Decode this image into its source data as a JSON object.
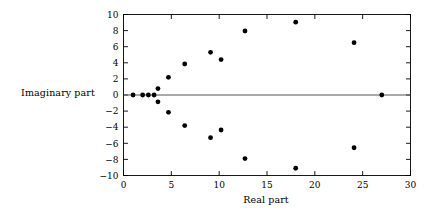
{
  "figure": {
    "xlabel": "Real part",
    "ylabel": "Imaginary part"
  },
  "chart_data": {
    "type": "scatter",
    "title": "",
    "xlabel": "Real part",
    "ylabel": "Imaginary part",
    "xlim": [
      0,
      30
    ],
    "ylim": [
      -10,
      10
    ],
    "xticks": [
      0,
      5,
      10,
      15,
      20,
      25,
      30
    ],
    "xticklabels": [
      "0",
      "5",
      "10",
      "15",
      "20",
      "25",
      "30"
    ],
    "yticks": [
      -10,
      -8,
      -6,
      -4,
      -2,
      0,
      2,
      4,
      6,
      8,
      10
    ],
    "yticklabels": [
      "−10",
      "−8",
      "−6",
      "−4",
      "−2",
      "0",
      "2",
      "4",
      "6",
      "8",
      "10"
    ],
    "grid": false,
    "legend": null,
    "marker": "filled-circle",
    "marker_color": "#000000",
    "marker_size": 2.4,
    "axis_line": {
      "y": 0,
      "color": "#555555"
    },
    "points": [
      {
        "x": 1.0,
        "y": 0.0
      },
      {
        "x": 2.0,
        "y": 0.0
      },
      {
        "x": 2.6,
        "y": 0.0
      },
      {
        "x": 3.2,
        "y": 0.0
      },
      {
        "x": 3.6,
        "y": 0.8
      },
      {
        "x": 3.6,
        "y": -0.85
      },
      {
        "x": 4.7,
        "y": 2.2
      },
      {
        "x": 4.7,
        "y": -2.15
      },
      {
        "x": 6.4,
        "y": 3.85
      },
      {
        "x": 6.4,
        "y": -3.8
      },
      {
        "x": 9.1,
        "y": 5.3
      },
      {
        "x": 9.1,
        "y": -5.3
      },
      {
        "x": 10.2,
        "y": 4.4
      },
      {
        "x": 10.2,
        "y": -4.35
      },
      {
        "x": 12.7,
        "y": 7.95
      },
      {
        "x": 12.7,
        "y": -7.9
      },
      {
        "x": 18.0,
        "y": 9.05
      },
      {
        "x": 18.0,
        "y": -9.1
      },
      {
        "x": 24.1,
        "y": 6.5
      },
      {
        "x": 24.1,
        "y": -6.55
      },
      {
        "x": 27.0,
        "y": 0.0
      }
    ]
  }
}
